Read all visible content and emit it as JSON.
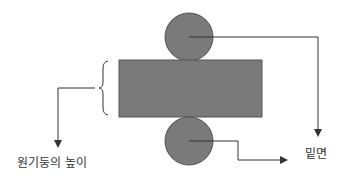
{
  "diagram": {
    "labels": {
      "height": "원기둥의 높이",
      "base": "밑면"
    },
    "colors": {
      "shape_fill": "#7a7a7a",
      "shape_stroke": "#555555",
      "line": "#333333",
      "text": "#333333"
    },
    "shapes": {
      "top_circle": {
        "cx": 189,
        "cy": 37,
        "r": 24
      },
      "rectangle": {
        "x": 119,
        "y": 60,
        "width": 143,
        "height": 57
      },
      "bottom_circle": {
        "cx": 189,
        "cy": 141,
        "r": 24
      }
    }
  }
}
